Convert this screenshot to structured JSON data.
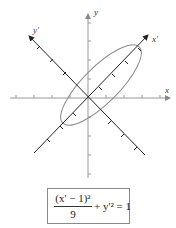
{
  "diagram": {
    "axes": {
      "x_label": "x",
      "y_label": "y",
      "x_prime_label": "x'",
      "y_prime_label": "y'"
    },
    "equation": {
      "numerator": "(x' − 1)²",
      "denominator": "9",
      "rest": "+ y'² = 1"
    },
    "colors": {
      "axis": "#999999",
      "rotated_axis": "#222222",
      "ellipse": "#8a8a8a"
    }
  }
}
